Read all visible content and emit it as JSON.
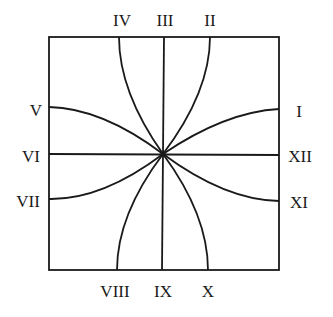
{
  "diagram": {
    "type": "sundial-hour-lines",
    "frame": {
      "x": 49,
      "y": 37,
      "width": 230,
      "height": 233
    },
    "center": {
      "x": 163,
      "y": 154
    },
    "stroke_color": "#1a1a1a",
    "labels": {
      "top": [
        "IV",
        "III",
        "II"
      ],
      "left": [
        "V",
        "VI",
        "VII"
      ],
      "right": [
        "I",
        "XII",
        "XI"
      ],
      "bottom": [
        "VIII",
        "IX",
        "X"
      ]
    },
    "hour_lines": [
      {
        "hour": "I",
        "edge": "right",
        "end": [
          279,
          109
        ]
      },
      {
        "hour": "II",
        "edge": "top",
        "end": [
          210,
          37
        ]
      },
      {
        "hour": "III",
        "edge": "top",
        "end": [
          164,
          37
        ]
      },
      {
        "hour": "IV",
        "edge": "top",
        "end": [
          119,
          37
        ]
      },
      {
        "hour": "V",
        "edge": "left",
        "end": [
          49,
          107
        ]
      },
      {
        "hour": "VI",
        "edge": "left",
        "end": [
          49,
          154
        ]
      },
      {
        "hour": "VII",
        "edge": "left",
        "end": [
          49,
          199
        ]
      },
      {
        "hour": "VIII",
        "edge": "bottom",
        "end": [
          117,
          270
        ]
      },
      {
        "hour": "IX",
        "edge": "bottom",
        "end": [
          162,
          270
        ]
      },
      {
        "hour": "X",
        "edge": "bottom",
        "end": [
          208,
          270
        ]
      },
      {
        "hour": "XI",
        "edge": "right",
        "end": [
          279,
          201
        ]
      },
      {
        "hour": "XII",
        "edge": "right",
        "end": [
          279,
          155
        ]
      }
    ]
  }
}
